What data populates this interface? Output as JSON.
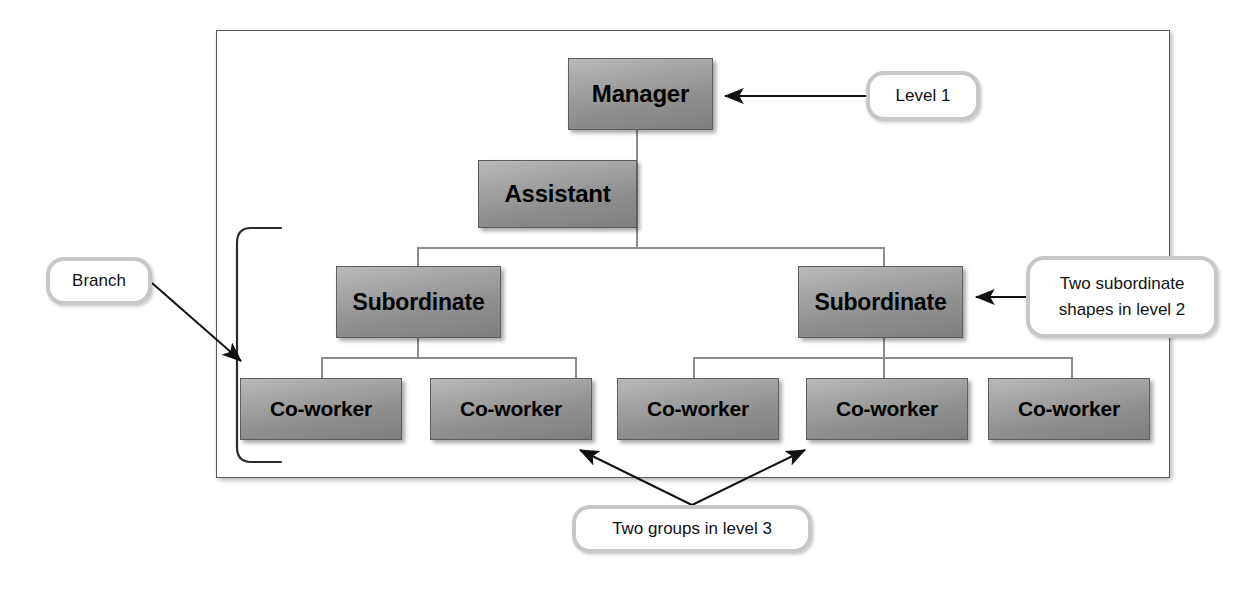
{
  "diagram": {
    "frame": {
      "label": "slide-canvas"
    },
    "colors": {
      "node_fill_light": "#b9b9b9",
      "node_fill_dark": "#7e7e7e",
      "node_border": "#5e5e5e",
      "connector": "#8d8d8d",
      "callout_border": "#c7c7c7",
      "callout_fill": "#ffffff",
      "frame_border": "#5a5a5a",
      "arrow": "#111111",
      "bracket": "#333333",
      "text": "#000000"
    },
    "nodes": {
      "manager": {
        "label": "Manager",
        "level": 1
      },
      "assistant": {
        "label": "Assistant",
        "level": 1
      },
      "subordinate_left": {
        "label": "Subordinate",
        "level": 2
      },
      "subordinate_right": {
        "label": "Subordinate",
        "level": 2
      },
      "coworkers": [
        {
          "label": "Co-worker",
          "group": "left",
          "level": 3
        },
        {
          "label": "Co-worker",
          "group": "left",
          "level": 3
        },
        {
          "label": "Co-worker",
          "group": "right",
          "level": 3
        },
        {
          "label": "Co-worker",
          "group": "right",
          "level": 3
        },
        {
          "label": "Co-worker",
          "group": "right",
          "level": 3
        }
      ]
    },
    "callouts": {
      "level1": {
        "text": "Level 1",
        "points_to": "manager"
      },
      "branch": {
        "text": "Branch",
        "points_to": "left-branch-bracket"
      },
      "level2": {
        "line1": "Two subordinate",
        "line2": "shapes in level 2",
        "points_to": "subordinate_right"
      },
      "level3": {
        "text": "Two groups in level 3",
        "points_to": "coworker-groups"
      }
    }
  }
}
